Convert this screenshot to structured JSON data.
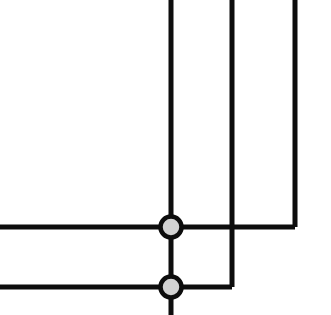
{
  "canvas": {
    "width": 331,
    "height": 315,
    "background": "#ffffff",
    "title": "Line Junction Diagram"
  },
  "style": {
    "line_color": "#0d0d0d",
    "line_width": 5,
    "junction_fill": "#d2d2d2",
    "junction_stroke": "#0d0d0d",
    "junction_stroke_width": 4.5,
    "junction_radius": 10.5
  },
  "graph": {
    "vertical_lines": [
      {
        "name": "vertical-line-left",
        "x": 171,
        "y_start": 0,
        "y_end": 315,
        "note": "runs full height through both junctions to bottom edge"
      },
      {
        "name": "vertical-line-middle",
        "x": 232,
        "y_start": 0,
        "y_end": 287,
        "note": "crosses upper horizontal without junction, elbows left into lower horizontal"
      },
      {
        "name": "vertical-line-right",
        "x": 295,
        "y_start": 0,
        "y_end": 227,
        "note": "elbows left into upper horizontal"
      }
    ],
    "horizontal_lines": [
      {
        "name": "horizontal-line-upper",
        "y": 227,
        "x_start": 0,
        "x_end": 295,
        "note": "enters from left edge, terminates at right elbow"
      },
      {
        "name": "horizontal-line-lower",
        "y": 287,
        "x_start": 0,
        "x_end": 232,
        "note": "enters from left edge, terminates at middle elbow"
      }
    ],
    "junctions": [
      {
        "name": "junction-upper",
        "x": 171,
        "y": 227,
        "degree": 4,
        "filled": true
      },
      {
        "name": "junction-lower",
        "x": 171,
        "y": 287,
        "degree": 4,
        "filled": true
      }
    ],
    "crossovers": [
      {
        "name": "crossover-no-junction",
        "x": 232,
        "y": 227,
        "note": "lines cross without electrical connection"
      }
    ]
  }
}
